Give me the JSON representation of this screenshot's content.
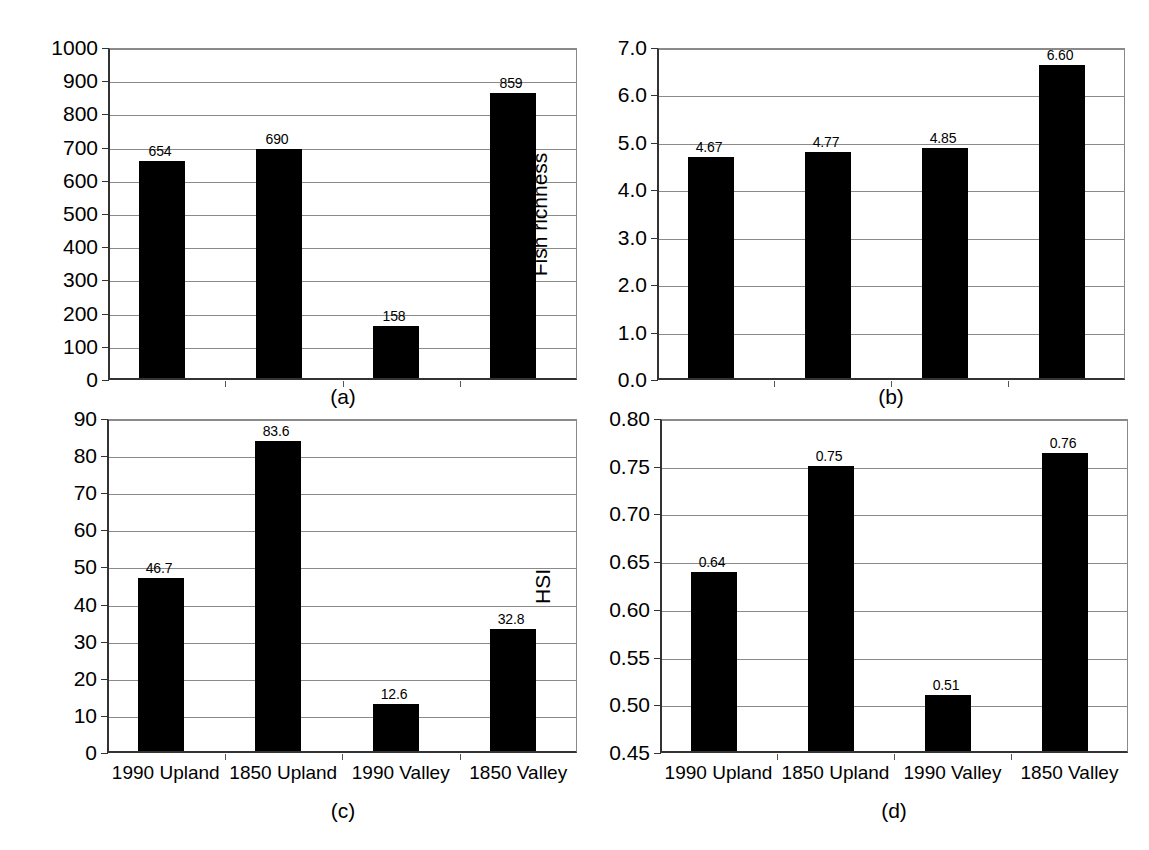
{
  "figure": {
    "background_color": "#ffffff",
    "bar_color": "#000000",
    "grid_color": "#8a8a8a",
    "axis_color": "#333333",
    "categories": [
      "1990 Upland",
      "1850 Upland",
      "1990 Valley",
      "1850 Valley"
    ]
  },
  "chart_data": [
    {
      "type": "bar",
      "panel": "a",
      "caption": "(a)",
      "title": "",
      "xlabel": "",
      "ylabel": "Cutthroat abundance",
      "categories": [
        "1990 Upland",
        "1850 Upland",
        "1990 Valley",
        "1850 Valley"
      ],
      "values": [
        654,
        690,
        158,
        859
      ],
      "value_labels": [
        "654",
        "690",
        "158",
        "859"
      ],
      "ylim": [
        0,
        1000
      ],
      "ytick_values": [
        0,
        100,
        200,
        300,
        400,
        500,
        600,
        700,
        800,
        900,
        1000
      ],
      "ytick_labels": [
        "0",
        "100",
        "200",
        "300",
        "400",
        "500",
        "600",
        "700",
        "800",
        "900",
        "1000"
      ],
      "grid": true,
      "legend": "none",
      "xtick_labels_visible": false
    },
    {
      "type": "bar",
      "panel": "b",
      "caption": "(b)",
      "title": "",
      "xlabel": "",
      "ylabel": "Fish richness",
      "categories": [
        "1990 Upland",
        "1850 Upland",
        "1990 Valley",
        "1850 Valley"
      ],
      "values": [
        4.67,
        4.77,
        4.85,
        6.6
      ],
      "value_labels": [
        "4.67",
        "4.77",
        "4.85",
        "6.60"
      ],
      "ylim": [
        0,
        7
      ],
      "ytick_values": [
        0,
        1,
        2,
        3,
        4,
        5,
        6,
        7
      ],
      "ytick_labels": [
        "0.0",
        "1.0",
        "2.0",
        "3.0",
        "4.0",
        "5.0",
        "6.0",
        "7.0"
      ],
      "grid": true,
      "legend": "none",
      "xtick_labels_visible": false
    },
    {
      "type": "bar",
      "panel": "c",
      "caption": "(c)",
      "title": "",
      "xlabel": "",
      "ylabel": "Wood volume",
      "categories": [
        "1990 Upland",
        "1850 Upland",
        "1990 Valley",
        "1850 Valley"
      ],
      "values": [
        46.7,
        83.6,
        12.6,
        32.8
      ],
      "value_labels": [
        "46.7",
        "83.6",
        "12.6",
        "32.8"
      ],
      "ylim": [
        0,
        90
      ],
      "ytick_values": [
        0,
        10,
        20,
        30,
        40,
        50,
        60,
        70,
        80,
        90
      ],
      "ytick_labels": [
        "0",
        "10",
        "20",
        "30",
        "40",
        "50",
        "60",
        "70",
        "80",
        "90"
      ],
      "grid": true,
      "legend": "none",
      "xtick_labels_visible": true
    },
    {
      "type": "bar",
      "panel": "d",
      "caption": "(d)",
      "title": "",
      "xlabel": "",
      "ylabel": "HSI",
      "categories": [
        "1990 Upland",
        "1850 Upland",
        "1990 Valley",
        "1850 Valley"
      ],
      "values": [
        0.638,
        0.749,
        0.509,
        0.762
      ],
      "value_labels": [
        "0.64",
        "0.75",
        "0.51",
        "0.76"
      ],
      "ylim": [
        0.45,
        0.8
      ],
      "ytick_values": [
        0.45,
        0.5,
        0.55,
        0.6,
        0.65,
        0.7,
        0.75,
        0.8
      ],
      "ytick_labels": [
        "0.45",
        "0.50",
        "0.55",
        "0.60",
        "0.65",
        "0.70",
        "0.75",
        "0.80"
      ],
      "grid": true,
      "legend": "none",
      "xtick_labels_visible": true
    }
  ]
}
